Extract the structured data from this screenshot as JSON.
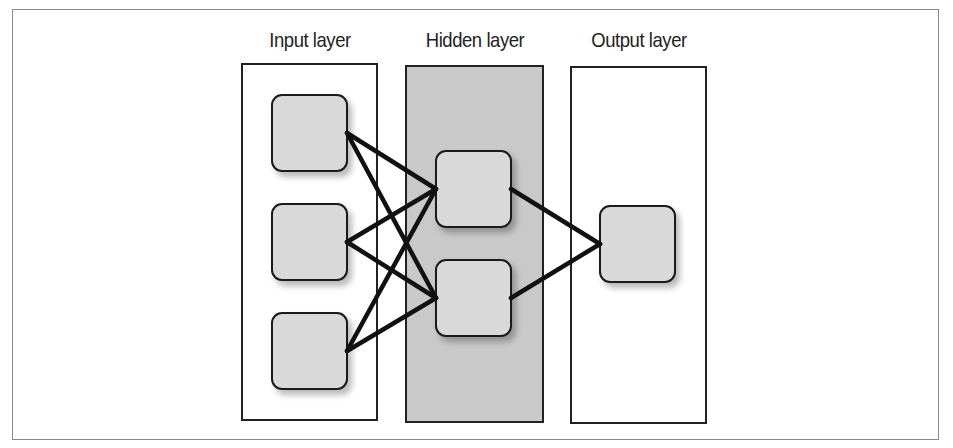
{
  "diagram": {
    "type": "neural-network",
    "layers": [
      {
        "id": "input",
        "label": "Input layer",
        "node_count": 3,
        "shaded": false
      },
      {
        "id": "hidden",
        "label": "Hidden layer",
        "node_count": 2,
        "shaded": true
      },
      {
        "id": "output",
        "label": "Output layer",
        "node_count": 1,
        "shaded": false
      }
    ],
    "edges": [
      [
        "input-1",
        "hidden-1"
      ],
      [
        "input-1",
        "hidden-2"
      ],
      [
        "input-2",
        "hidden-1"
      ],
      [
        "input-2",
        "hidden-2"
      ],
      [
        "input-3",
        "hidden-1"
      ],
      [
        "input-3",
        "hidden-2"
      ],
      [
        "hidden-1",
        "output-1"
      ],
      [
        "hidden-2",
        "output-1"
      ]
    ],
    "colors": {
      "node_fill": "#d9d9d9",
      "hidden_layer_fill": "#c9c9c9",
      "stroke": "#1a1a1a"
    }
  }
}
